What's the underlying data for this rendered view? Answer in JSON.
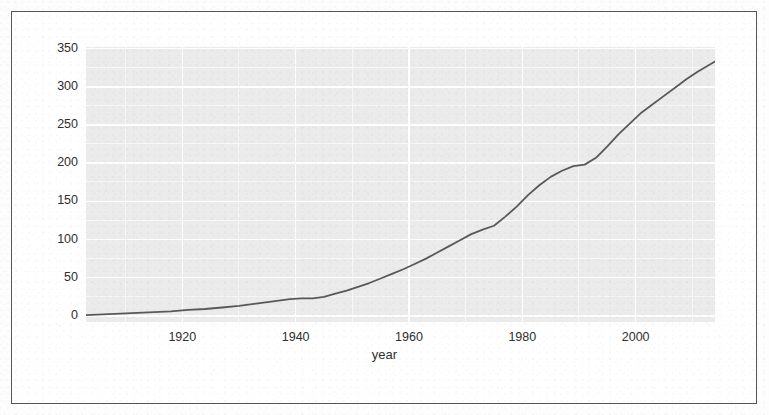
{
  "figure": {
    "background_color": "#ffffff",
    "panel_color": "#ebebeb",
    "grid_color": "#ffffff",
    "line_color": "#595959",
    "border_color": "#53565c"
  },
  "chart_data": {
    "type": "line",
    "title": "",
    "xlabel": "year",
    "ylabel": "",
    "xlim": [
      1903,
      2014
    ],
    "ylim": [
      -8,
      352
    ],
    "grid": true,
    "legend": "none",
    "xticks": [
      1920,
      1940,
      1960,
      1980,
      2000
    ],
    "xtick_labels": [
      "1920",
      "1940",
      "1960",
      "1980",
      "2000"
    ],
    "yticks": [
      0,
      50,
      100,
      150,
      200,
      250,
      300,
      350
    ],
    "ytick_labels": [
      "0",
      "50",
      "100",
      "150",
      "200",
      "250",
      "300",
      "350"
    ],
    "series": [
      {
        "name": "count",
        "color": "#595959",
        "x": [
          1903,
          1906,
          1909,
          1912,
          1915,
          1918,
          1921,
          1924,
          1927,
          1930,
          1933,
          1936,
          1939,
          1941,
          1943,
          1945,
          1947,
          1949,
          1951,
          1953,
          1955,
          1957,
          1959,
          1961,
          1963,
          1965,
          1967,
          1969,
          1971,
          1973,
          1975,
          1977,
          1979,
          1981,
          1983,
          1985,
          1987,
          1989,
          1991,
          1993,
          1995,
          1997,
          1999,
          2001,
          2003,
          2005,
          2007,
          2009,
          2011,
          2014
        ],
        "y": [
          1,
          2,
          3,
          4,
          5,
          6,
          8,
          9,
          11,
          13,
          16,
          19,
          22,
          23,
          23,
          25,
          29,
          33,
          38,
          43,
          49,
          55,
          61,
          68,
          75,
          83,
          91,
          99,
          107,
          113,
          118,
          130,
          143,
          158,
          171,
          182,
          190,
          196,
          198,
          207,
          222,
          238,
          252,
          266,
          277,
          288,
          299,
          310,
          320,
          333
        ]
      }
    ]
  },
  "axis": {
    "x_title": "year"
  }
}
